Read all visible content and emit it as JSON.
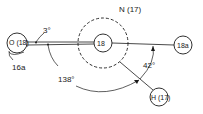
{
  "diagram": {
    "nodes": {
      "center": {
        "label": "18"
      },
      "outer_ring": {
        "label": "N (17)"
      },
      "left": {
        "label": "O (18)"
      },
      "right": {
        "label": "18a"
      },
      "bottom": {
        "label": "H (17)"
      }
    },
    "angles": {
      "small": "3°",
      "large": "138°",
      "right": "42°"
    },
    "annotations": {
      "left_arrow": "16a"
    },
    "colors": {
      "stroke": "#1a1a1a",
      "background": "#ffffff"
    }
  }
}
